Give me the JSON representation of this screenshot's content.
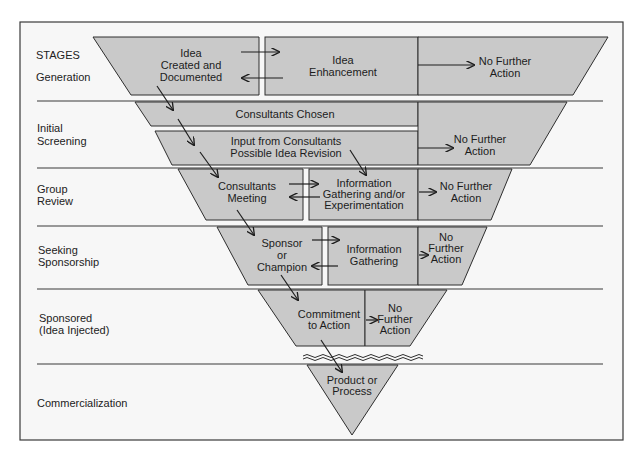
{
  "title": "STAGES",
  "stages": [
    {
      "label_lines": [
        "Generation"
      ]
    },
    {
      "label_lines": [
        "Initial",
        "Screening"
      ]
    },
    {
      "label_lines": [
        "Group",
        "Review"
      ]
    },
    {
      "label_lines": [
        "Seeking",
        "Sponsorship"
      ]
    },
    {
      "label_lines": [
        "Sponsored",
        "(Idea Injected)"
      ]
    },
    {
      "label_lines": [
        "Commercialization"
      ]
    }
  ],
  "boxes": {
    "idea_created": [
      "Idea",
      "Created and",
      "Documented"
    ],
    "idea_enhancement": [
      "Idea",
      "Enhancement"
    ],
    "no_action_1": [
      "No Further",
      "Action"
    ],
    "consultants_chosen": [
      "Consultants Chosen"
    ],
    "input_from_consultants": [
      "Input from Consultants",
      "Possible Idea Revision"
    ],
    "no_action_2": [
      "No Further",
      "Action"
    ],
    "consultants_meeting": [
      "Consultants",
      "Meeting"
    ],
    "info_gathering_experimentation": [
      "Information",
      "Gathering and/or",
      "Experimentation"
    ],
    "no_action_3": [
      "No Further",
      "Action"
    ],
    "sponsor_champion": [
      "Sponsor",
      "or",
      "Champion"
    ],
    "info_gathering": [
      "Information",
      "Gathering"
    ],
    "no_action_4": [
      "No",
      "Further",
      "Action"
    ],
    "commitment": [
      "Commitment",
      "to Action"
    ],
    "no_action_5": [
      "No",
      "Further",
      "Action"
    ],
    "product_process": [
      "Product or",
      "Process"
    ]
  },
  "colors": {
    "box_fill": "#c9c9c9",
    "frame_fill": "#f7f7f7",
    "line": "#2e2e2e"
  }
}
